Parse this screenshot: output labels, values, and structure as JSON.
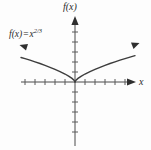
{
  "figure": {
    "title": "",
    "background_color": "#fdfdfd",
    "ink_color": "#4a4a4a",
    "text_color": "#2b2b2b",
    "axis_label_y": "f(x)",
    "axis_label_x": "x",
    "function_label": {
      "lhs": "f(x)",
      "equals": "=",
      "base": "x",
      "exponent": "2/3"
    }
  },
  "chart_data": {
    "type": "line",
    "title": "",
    "xlabel": "x",
    "ylabel": "f(x)",
    "expression": "f(x) = x^(2/3)",
    "xlim": [
      -5.5,
      6.0
    ],
    "ylim": [
      -6.5,
      6.5
    ],
    "grid": false,
    "legend": null,
    "x_tick_count_negative": 5,
    "x_tick_count_positive": 6,
    "y_tick_count_positive": 6,
    "y_tick_count_negative": 6,
    "tick_spacing_units": 1,
    "series": [
      {
        "name": "f(x) = x^(2/3)",
        "x": [
          -5.4,
          -5.0,
          -4.5,
          -4.0,
          -3.5,
          -3.0,
          -2.5,
          -2.0,
          -1.5,
          -1.0,
          -0.6,
          -0.3,
          -0.1,
          0.0,
          0.1,
          0.3,
          0.6,
          1.0,
          1.5,
          2.0,
          2.5,
          3.0,
          3.5,
          4.0,
          4.5,
          5.0,
          5.5,
          6.0
        ],
        "y": [
          3.06,
          2.92,
          2.73,
          2.52,
          2.31,
          2.08,
          1.84,
          1.59,
          1.31,
          1.0,
          0.71,
          0.45,
          0.22,
          0.0,
          0.22,
          0.45,
          0.71,
          1.0,
          1.31,
          1.59,
          1.84,
          2.08,
          2.31,
          2.52,
          2.73,
          2.92,
          3.11,
          3.3
        ],
        "arrow_start": true,
        "arrow_end": true,
        "cusp_at": [
          0,
          0
        ]
      }
    ],
    "annotations": [
      {
        "text": "f(x) = x^(2/3)",
        "x": -4.9,
        "y": 4.6
      }
    ]
  }
}
